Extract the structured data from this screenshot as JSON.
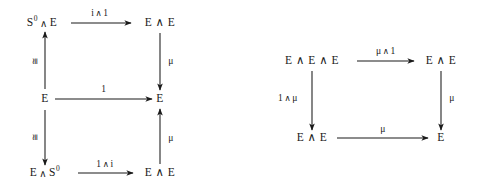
{
  "figure": {
    "kind": "commutative-diagram-pair",
    "ink_color": "#1a1a1a",
    "background_color": "#ffffff"
  },
  "wedge": "∧",
  "left_diagram": {
    "name": "unit-axiom-diagram",
    "nodes": {
      "top_left": {
        "text": "S⁰ ∧ E",
        "base": "S",
        "exponent": "0",
        "partner": "E"
      },
      "top_right": {
        "text": "E ∧ E"
      },
      "middle_left": {
        "text": "E"
      },
      "middle_right": {
        "text": "E"
      },
      "bottom_left": {
        "text": "E ∧ S⁰",
        "base": "E",
        "partner": "S",
        "exponent": "0"
      },
      "bottom_right": {
        "text": "E ∧ E"
      }
    },
    "arrows": {
      "top": {
        "label": "i ∧ 1",
        "left": "i",
        "right": "1",
        "direction": "right"
      },
      "middle": {
        "label": "1",
        "direction": "right"
      },
      "bottom": {
        "label": "1 ∧ i",
        "left": "1",
        "right": "i",
        "direction": "right"
      },
      "left_upper": {
        "label": "≅",
        "direction": "up"
      },
      "left_lower": {
        "label": "≅",
        "direction": "down"
      },
      "right_upper": {
        "label": "μ",
        "direction": "down"
      },
      "right_lower": {
        "label": "μ",
        "direction": "up"
      }
    }
  },
  "right_diagram": {
    "name": "associativity-axiom-diagram",
    "nodes": {
      "top_left": {
        "text": "E ∧ E ∧ E"
      },
      "top_right": {
        "text": "E ∧ E"
      },
      "bottom_left": {
        "text": "E ∧ E"
      },
      "bottom_right": {
        "text": "E"
      }
    },
    "arrows": {
      "top": {
        "label": "μ ∧ 1",
        "left": "μ",
        "right": "1",
        "direction": "right"
      },
      "bottom": {
        "label": "μ",
        "direction": "right"
      },
      "left": {
        "label": "1 ∧ μ",
        "left": "1",
        "right": "μ",
        "direction": "down"
      },
      "right": {
        "label": "μ",
        "direction": "down"
      }
    }
  }
}
